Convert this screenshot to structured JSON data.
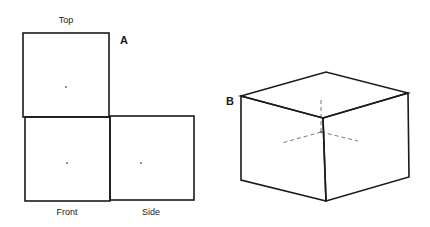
{
  "panels": {
    "a": {
      "letter": "A",
      "views": [
        {
          "label": "Top",
          "box": [
            23,
            33,
            86,
            84
          ],
          "dot": [
            66,
            87
          ],
          "label_pos": [
            66,
            20
          ]
        },
        {
          "label": "Front",
          "box": [
            25,
            117,
            85,
            84
          ],
          "dot": [
            67,
            163
          ],
          "label_pos": [
            67,
            212
          ]
        },
        {
          "label": "Side",
          "box": [
            110,
            116,
            84,
            84
          ],
          "dot": [
            141,
            163
          ],
          "label_pos": [
            151,
            212
          ]
        }
      ],
      "letter_pos": [
        124,
        40
      ]
    },
    "b": {
      "letter": "B",
      "letter_pos": [
        230,
        101
      ],
      "cube": {
        "top_face": [
          [
            241,
            96
          ],
          [
            326,
            72
          ],
          [
            408,
            93
          ],
          [
            323,
            118
          ]
        ],
        "left_face": [
          [
            241,
            96
          ],
          [
            323,
            118
          ],
          [
            326,
            201
          ],
          [
            241,
            180
          ]
        ],
        "right_face": [
          [
            323,
            118
          ],
          [
            408,
            93
          ],
          [
            409,
            177
          ],
          [
            326,
            201
          ]
        ]
      },
      "hidden_axes": {
        "center": [
          321,
          132
        ],
        "ends": [
          [
            321,
            98
          ],
          [
            282,
            143
          ],
          [
            358,
            141
          ]
        ]
      }
    }
  },
  "colors": {
    "line": "#1a1a1a",
    "dash": "#555555",
    "dot": "#777777",
    "background": "#ffffff"
  }
}
